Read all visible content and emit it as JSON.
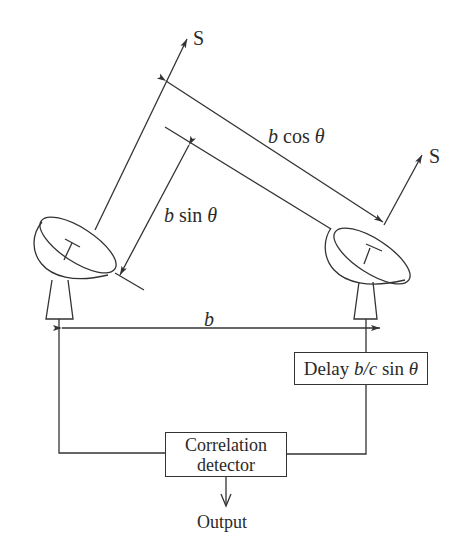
{
  "diagram": {
    "type": "two-element radio interferometer",
    "source_labels": {
      "left": "S",
      "right": "S"
    },
    "path_difference_label": {
      "var": "b",
      "func": "sin",
      "angle": "θ"
    },
    "projected_baseline_label": {
      "var": "b",
      "func": "cos",
      "angle": "θ"
    },
    "baseline_label": "b",
    "delay_box": {
      "prefix": "Delay",
      "expr": "b/c",
      "func": "sin",
      "angle": "θ"
    },
    "correlator_box": {
      "line1": "Correlation",
      "line2": "detector"
    },
    "output_label": "Output",
    "stroke_color": "#333333"
  }
}
